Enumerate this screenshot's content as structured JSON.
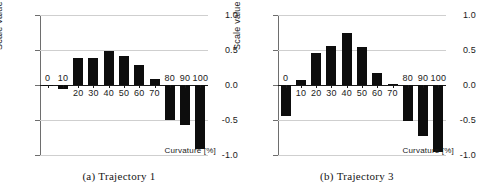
{
  "figure": {
    "panels": [
      {
        "id": "panel-a",
        "caption": "(a) Trajectory 1",
        "chart_index": 0
      },
      {
        "id": "panel-b",
        "caption": "(b) Trajectory 3",
        "chart_index": 1
      }
    ],
    "colors": {
      "bar": "#0d0d0d",
      "gridline": "#cfcfcf",
      "axis": "#6e6e6e",
      "text": "#1a1a1a",
      "background": "#ffffff"
    }
  },
  "chart_data": [
    {
      "type": "bar",
      "title": "(a) Trajectory 1",
      "xlabel": "Curvature [%]",
      "ylabel": "Scale value",
      "categories": [
        "0",
        "10",
        "20",
        "30",
        "40",
        "50",
        "60",
        "70",
        "80",
        "90",
        "100"
      ],
      "values": [
        -0.02,
        -0.06,
        0.38,
        0.39,
        0.49,
        0.41,
        0.28,
        0.08,
        -0.5,
        -0.57,
        -0.92
      ],
      "ylim": [
        -1.0,
        1.0
      ],
      "yticks": [
        "1.0",
        "0.5",
        "0.0",
        "-0.5",
        "-1.0"
      ],
      "ytick_values": [
        1.0,
        0.5,
        0.0,
        -0.5,
        -1.0
      ],
      "grid": true,
      "legend": "none"
    },
    {
      "type": "bar",
      "title": "(b) Trajectory 3",
      "xlabel": "Curvature [%]",
      "ylabel": "Scale value",
      "categories": [
        "0",
        "10",
        "20",
        "30",
        "40",
        "50",
        "60",
        "70",
        "80",
        "90",
        "100"
      ],
      "values": [
        -0.44,
        0.07,
        0.46,
        0.56,
        0.75,
        0.54,
        0.17,
        0.01,
        -0.52,
        -0.73,
        -0.95
      ],
      "ylim": [
        -1.0,
        1.0
      ],
      "yticks": [
        "1.0",
        "0.5",
        "0.0",
        "-0.5",
        "-1.0"
      ],
      "ytick_values": [
        1.0,
        0.5,
        0.0,
        -0.5,
        -1.0
      ],
      "grid": true,
      "legend": "none"
    }
  ]
}
